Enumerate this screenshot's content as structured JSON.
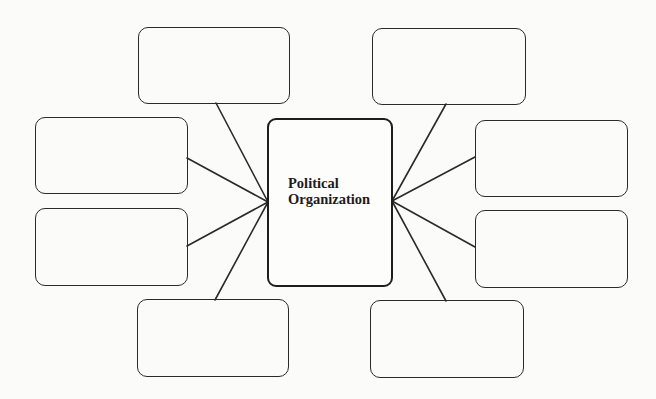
{
  "diagram": {
    "type": "spider-map",
    "center": {
      "title_lines": [
        "Political",
        "Organization"
      ]
    },
    "colors": {
      "stroke": "#2a2a2a",
      "background": "#fbfbfa",
      "text": "#1c1c1c"
    },
    "branches": [
      {
        "id": "top-left",
        "text": ""
      },
      {
        "id": "left-upper",
        "text": ""
      },
      {
        "id": "left-lower",
        "text": ""
      },
      {
        "id": "bottom-left",
        "text": ""
      },
      {
        "id": "top-right",
        "text": ""
      },
      {
        "id": "right-upper",
        "text": ""
      },
      {
        "id": "right-lower",
        "text": ""
      },
      {
        "id": "bottom-right",
        "text": ""
      }
    ]
  }
}
